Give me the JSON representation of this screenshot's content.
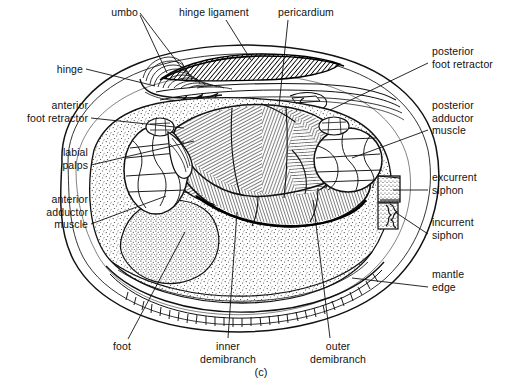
{
  "figure": {
    "caption": "(c)",
    "view": "left valve and mantle removed, sagittal internal view",
    "background_color": "#ffffff",
    "ink_color": "#111111"
  },
  "labels": [
    {
      "id": "umbo",
      "text": "umbo",
      "lines": [
        "umbo"
      ],
      "align": "right",
      "x": 93,
      "y": 6,
      "w": 45,
      "leaders": [
        [
          [
            140,
            13
          ],
          [
            181,
            67
          ]
        ],
        [
          [
            140,
            15
          ],
          [
            167,
            73
          ]
        ]
      ]
    },
    {
      "id": "hinge-ligament",
      "text": "hinge ligament",
      "lines": [
        "hinge ligament"
      ],
      "align": "left",
      "x": 179,
      "y": 6,
      "w": 80,
      "leaders": [
        [
          [
            226,
            20
          ],
          [
            251,
            60
          ]
        ]
      ]
    },
    {
      "id": "pericardium",
      "text": "pericardium",
      "lines": [
        "pericardium"
      ],
      "align": "left",
      "x": 278,
      "y": 6,
      "w": 65,
      "leaders": [
        [
          [
            288,
            20
          ],
          [
            279,
            106
          ]
        ]
      ]
    },
    {
      "id": "hinge",
      "text": "hinge",
      "lines": [
        "hinge"
      ],
      "align": "right",
      "x": 38,
      "y": 63,
      "w": 45,
      "leaders": [
        [
          [
            86,
            69
          ],
          [
            155,
            86
          ]
        ]
      ]
    },
    {
      "id": "anterior-foot-retractor",
      "text": "anterior foot retractor",
      "lines": [
        "anterior",
        "foot retractor"
      ],
      "align": "right",
      "x": 10,
      "y": 99,
      "w": 78,
      "leaders": [
        [
          [
            91,
            118
          ],
          [
            184,
            128
          ]
        ]
      ]
    },
    {
      "id": "labial-palps",
      "text": "labial palps",
      "lines": [
        "labial",
        "palps"
      ],
      "align": "right",
      "x": 30,
      "y": 146,
      "w": 58,
      "leaders": [
        [
          [
            91,
            165
          ],
          [
            194,
            141
          ]
        ]
      ]
    },
    {
      "id": "anterior-adductor-muscle",
      "text": "anterior adductor muscle",
      "lines": [
        "anterior",
        "adductor",
        "muscle"
      ],
      "align": "right",
      "x": 18,
      "y": 193,
      "w": 70,
      "leaders": [
        [
          [
            91,
            224
          ],
          [
            166,
            196
          ]
        ]
      ]
    },
    {
      "id": "posterior-foot-retractor",
      "text": "posterior foot retractor",
      "lines": [
        "posterior",
        "foot retractor"
      ],
      "align": "left",
      "x": 432,
      "y": 45,
      "w": 82,
      "leaders": [
        [
          [
            428,
            63
          ],
          [
            330,
            110
          ]
        ]
      ]
    },
    {
      "id": "posterior-adductor-muscle",
      "text": "posterior adductor muscle",
      "lines": [
        "posterior",
        "adductor",
        "muscle"
      ],
      "align": "left",
      "x": 432,
      "y": 99,
      "w": 82,
      "leaders": [
        [
          [
            428,
            130
          ],
          [
            352,
            158
          ]
        ]
      ]
    },
    {
      "id": "excurrent-siphon",
      "text": "excurrent siphon",
      "lines": [
        "excurrent",
        "siphon"
      ],
      "align": "left",
      "x": 432,
      "y": 171,
      "w": 82,
      "leaders": [
        [
          [
            428,
            190
          ],
          [
            393,
            190
          ]
        ]
      ]
    },
    {
      "id": "incurrent-siphon",
      "text": "incurrent siphon",
      "lines": [
        "incurrent",
        "siphon"
      ],
      "align": "left",
      "x": 432,
      "y": 216,
      "w": 82,
      "leaders": [
        [
          [
            428,
            234
          ],
          [
            395,
            212
          ]
        ]
      ]
    },
    {
      "id": "mantle-edge",
      "text": "mantle edge",
      "lines": [
        "mantle",
        "edge"
      ],
      "align": "left",
      "x": 432,
      "y": 268,
      "w": 82,
      "leaders": [
        [
          [
            428,
            287
          ],
          [
            352,
            278
          ]
        ]
      ]
    },
    {
      "id": "foot",
      "text": "foot",
      "lines": [
        "foot"
      ],
      "align": "center",
      "x": 101,
      "y": 340,
      "w": 42,
      "leaders": [
        [
          [
            128,
            339
          ],
          [
            185,
            232
          ]
        ]
      ]
    },
    {
      "id": "inner-demibranch",
      "text": "inner demibranch",
      "lines": [
        "inner",
        "demibranch"
      ],
      "align": "center",
      "x": 186,
      "y": 340,
      "w": 84,
      "leaders": [
        [
          [
            228,
            338
          ],
          [
            237,
            212
          ]
        ]
      ]
    },
    {
      "id": "outer-demibranch",
      "text": "outer demibranch",
      "lines": [
        "outer",
        "demibranch"
      ],
      "align": "center",
      "x": 296,
      "y": 340,
      "w": 84,
      "leaders": [
        [
          [
            330,
            338
          ],
          [
            313,
            200
          ]
        ]
      ]
    }
  ]
}
